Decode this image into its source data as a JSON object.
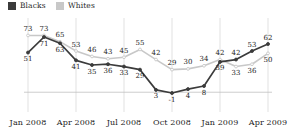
{
  "legend": {
    "items": [
      {
        "label": "Blacks",
        "color": "#3b3b3b",
        "key": "blacks"
      },
      {
        "label": "Whites",
        "color": "#c8c8c8",
        "key": "whites"
      }
    ]
  },
  "axis": {
    "x_tick_labels": [
      "Jan 2008",
      "Apr 2008",
      "Jul 2008",
      "Oct 2008",
      "Jan 2009",
      "Apr 2009"
    ]
  },
  "chart_data": {
    "type": "line",
    "title": "",
    "subtitle": "",
    "xlabel": "",
    "ylabel": "",
    "grid": "vertical-gridlines-at-quarter-ticks plus zero-line",
    "legend_position": "top-left",
    "x": [
      "Jan 2008",
      "Feb 2008",
      "Mar 2008",
      "Apr 2008",
      "May 2008",
      "Jun 2008",
      "Jul 2008",
      "Aug 2008",
      "Sep 2008",
      "Oct 2008",
      "Nov 2008",
      "Dec 2008",
      "Jan 2009",
      "Feb 2009",
      "Mar 2009",
      "Apr 2009"
    ],
    "x_tick_indices": [
      0,
      3,
      6,
      9,
      12,
      15
    ],
    "ylim": [
      -10,
      80
    ],
    "zero_line": 0,
    "series": [
      {
        "name": "Blacks",
        "color": "#3b3b3b",
        "values": [
          51,
          71,
          63,
          41,
          35,
          36,
          33,
          29,
          3,
          -1,
          4,
          8,
          39,
          42,
          53,
          62
        ],
        "label_positions": [
          "below",
          "below",
          "below",
          "below",
          "below",
          "below",
          "below",
          "below",
          "below",
          "below",
          "below",
          "below",
          "below",
          "above",
          "above",
          "above"
        ]
      },
      {
        "name": "Whites",
        "color": "#c8c8c8",
        "values": [
          73,
          73,
          65,
          53,
          46,
          43,
          45,
          55,
          42,
          29,
          30,
          34,
          42,
          33,
          36,
          50
        ],
        "label_positions": [
          "above",
          "above",
          "above",
          "above",
          "above",
          "above",
          "above",
          "above",
          "above",
          "above",
          "above",
          "above",
          "above",
          "below",
          "below",
          "below"
        ]
      }
    ]
  }
}
